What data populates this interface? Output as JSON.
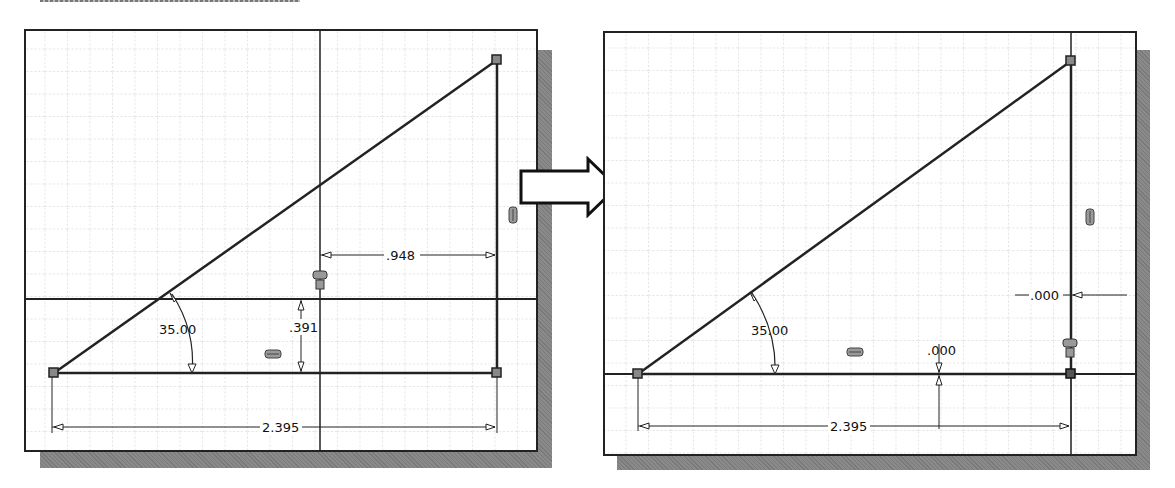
{
  "figure": {
    "arrow_icon": "right-arrow"
  },
  "left_panel": {
    "name": "before-sketch",
    "dimensions": {
      "angle": "35.00",
      "horizontal_offset": ".948",
      "vertical_offset": ".391",
      "base_length": "2.395"
    },
    "constraint_icons": [
      "coincident-icon",
      "horizontal-icon",
      "vertical-icon"
    ]
  },
  "right_panel": {
    "name": "after-sketch",
    "dimensions": {
      "angle": "35.00",
      "horizontal_offset": ".000",
      "vertical_offset": ".000",
      "base_length": "2.395"
    },
    "constraint_icons": [
      "coincident-icon",
      "horizontal-icon",
      "vertical-icon"
    ]
  },
  "colors": {
    "line": "#222222",
    "grid": "#c8c8c8",
    "shadow": "#8a8a8a",
    "background": "#ffffff"
  }
}
